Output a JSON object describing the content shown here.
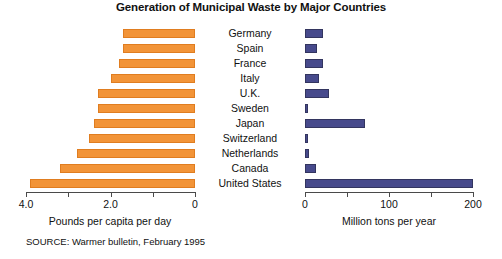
{
  "chart_data": {
    "type": "bar",
    "title": "Generation of Municipal Waste by Major Countries",
    "orientation": "horizontal",
    "layout": "back-to-back paired panels sharing centered category labels",
    "grid": false,
    "legend": "none",
    "categories": [
      "Germany",
      "Spain",
      "France",
      "Italy",
      "U.K.",
      "Sweden",
      "Japan",
      "Switzerland",
      "Netherlands",
      "Canada",
      "United States"
    ],
    "series": [
      {
        "name": "Pounds per capita per day",
        "panel": "left",
        "color": "#f29438",
        "axis_label": "Pounds per capita per day",
        "axis_reversed": true,
        "xlim": [
          4.0,
          0
        ],
        "ticks": [
          4.0,
          3.0,
          2.0,
          1.0,
          0
        ],
        "tick_labels": [
          "4.0",
          "",
          "2.0",
          "",
          "0"
        ],
        "values": [
          1.7,
          1.7,
          1.8,
          2.0,
          2.3,
          2.3,
          2.4,
          2.5,
          2.8,
          3.2,
          3.9
        ]
      },
      {
        "name": "Million tons per year",
        "panel": "right",
        "color": "#474a8c",
        "axis_label": "Million tons per year",
        "axis_reversed": false,
        "xlim": [
          0,
          200
        ],
        "ticks": [
          0,
          50,
          100,
          150,
          200
        ],
        "tick_labels": [
          "0",
          "",
          "100",
          "",
          "200"
        ],
        "values": [
          22,
          14,
          21,
          17,
          28,
          3,
          72,
          4,
          5,
          13,
          200
        ]
      }
    ]
  },
  "axes": {
    "left": {
      "caption": "Pounds per capita per day",
      "tick_labels": [
        "4.0",
        "",
        "2.0",
        "",
        "0"
      ]
    },
    "right": {
      "caption": "Million tons per year",
      "tick_labels": [
        "0",
        "",
        "100",
        "",
        "200"
      ]
    }
  },
  "footer": {
    "source": "SOURCE: Warmer bulletin, February 1995"
  },
  "colors": {
    "left_bar": "#f29438",
    "right_bar": "#474a8c",
    "axis": "#4a4a4a",
    "text": "#111111",
    "background": "#ffffff"
  }
}
